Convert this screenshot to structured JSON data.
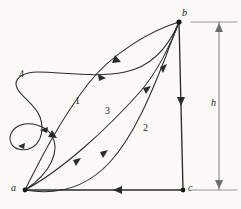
{
  "figure": {
    "background_color": "#fbfaf7",
    "ink_color": "#2b2b2b",
    "dimension_color": "#6e6e6e"
  },
  "vertices": [
    {
      "id": "a",
      "label": "a",
      "x": 25,
      "y": 190,
      "label_x": 11,
      "label_y": 184
    },
    {
      "id": "b",
      "label": "b",
      "x": 179,
      "y": 22,
      "label_x": 182,
      "label_y": 9
    },
    {
      "id": "c",
      "label": "c",
      "x": 183,
      "y": 190,
      "label_x": 187,
      "label_y": 184
    }
  ],
  "path_labels": [
    {
      "id": "1",
      "label": "1",
      "x": 75,
      "y": 97
    },
    {
      "id": "2",
      "label": "2",
      "x": 143,
      "y": 124
    },
    {
      "id": "3",
      "label": "3",
      "x": 105,
      "y": 107
    },
    {
      "id": "4",
      "label": "4",
      "x": 20,
      "y": 70
    }
  ],
  "dimension": {
    "label": "h",
    "label_x": 213,
    "label_y": 98,
    "line_x": 219,
    "top_y": 22,
    "bottom_y": 190,
    "tick_top_from_x": 191,
    "tick_top_to_x": 237,
    "tick_bottom_from_x": 191,
    "tick_bottom_to_x": 237
  },
  "edges": [
    {
      "id": "b-to-c",
      "from": "b",
      "to": "c",
      "kind": "straight-vertical",
      "arrow_direction": "down"
    },
    {
      "id": "c-to-a",
      "from": "c",
      "to": "a",
      "kind": "straight-horizontal",
      "arrow_direction": "left"
    }
  ],
  "curves": [
    {
      "id": "curve-1",
      "from": "a",
      "to": "b",
      "label": "1",
      "arrow_direction": "toward-b"
    },
    {
      "id": "curve-2",
      "from": "a",
      "to": "b",
      "label": "2",
      "arrow_direction": "toward-b"
    },
    {
      "id": "curve-3",
      "from": "a",
      "to": "b",
      "label": "3",
      "arrow_direction": "toward-b"
    },
    {
      "id": "curve-4",
      "from": "a",
      "to": "b",
      "label": "4",
      "arrow_direction": "toward-b",
      "has_small_loop": true
    }
  ]
}
